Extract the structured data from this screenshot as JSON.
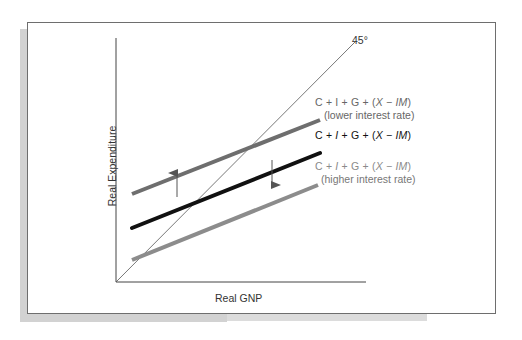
{
  "diagram": {
    "type": "keynesian-cross",
    "x_axis_label": "Real GNP",
    "y_axis_label": "Real Expenditure",
    "reference_line_label": "45°",
    "lines": [
      {
        "id": "lower-interest-rate",
        "equation_parts": [
          "C + I + G + (",
          "X",
          " − ",
          "IM",
          ")"
        ],
        "equation": "C + I + G + (X − IM)",
        "caption": "(lower interest rate)",
        "color": "#6e6e6e"
      },
      {
        "id": "baseline",
        "equation_parts": [
          "C + ",
          "I",
          " + G + (",
          "X",
          " − ",
          "IM",
          ")"
        ],
        "equation": "C + I + G + (X − IM)",
        "caption": "",
        "color": "#111111"
      },
      {
        "id": "higher-interest-rate",
        "equation_parts": [
          "C + ",
          "I",
          " + G + (",
          "X",
          " − ",
          "IM",
          ")"
        ],
        "equation": "C + I + G + (X − IM)",
        "caption": "(higher interest rate)",
        "color": "#8c8c8c"
      }
    ],
    "arrows": [
      {
        "direction": "up",
        "meaning": "shift up with lower interest rate"
      },
      {
        "direction": "down",
        "meaning": "shift down with higher interest rate"
      }
    ]
  }
}
